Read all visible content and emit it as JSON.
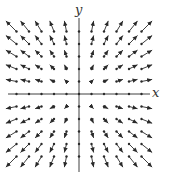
{
  "figure": {
    "x_axis_label": "x",
    "y_axis_label": "y",
    "color": "#2a2a2a",
    "origin_px": [
      79,
      94
    ],
    "spacing_px": 12.5,
    "grid_range": [
      -5,
      5
    ],
    "arrow_scale": 0.17,
    "axis_extent_px": {
      "x": [
        8,
        150
      ],
      "y": [
        18,
        172
      ]
    }
  }
}
